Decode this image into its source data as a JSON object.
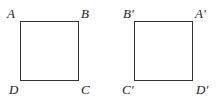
{
  "figure": {
    "left_square": {
      "labels": {
        "top_left": "A",
        "top_right": "B",
        "bottom_left": "D",
        "bottom_right": "C"
      }
    },
    "right_square": {
      "labels": {
        "top_left": "B′",
        "top_right": "A′",
        "bottom_left": "C′",
        "bottom_right": "D′"
      }
    },
    "stroke_color": "#333333"
  }
}
